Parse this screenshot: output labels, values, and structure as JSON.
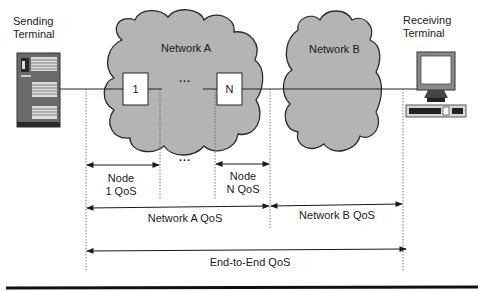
{
  "diagram": {
    "sending_terminal": {
      "label_line1": "Sending",
      "label_line2": "Terminal"
    },
    "receiving_terminal": {
      "label_line1": "Receiving",
      "label_line2": "Terminal"
    },
    "network_a": {
      "label": "Network A",
      "node_first": "1",
      "node_last": "N",
      "ellipsis": "..."
    },
    "network_b": {
      "label": "Network B"
    },
    "measurements": {
      "node1": {
        "line1": "Node",
        "line2": "1 QoS"
      },
      "nodeN": {
        "line1": "Node",
        "line2": "N QoS"
      },
      "between_nodes": "...",
      "network_a_qos": "Network A QoS",
      "network_b_qos": "Network B QoS",
      "end_to_end_qos": "End-to-End QoS"
    },
    "colors": {
      "cloud_fill": "#b4b4b4",
      "cloud_stroke": "#2a2a2a",
      "line": "#222222",
      "background": "#ffffff"
    }
  }
}
